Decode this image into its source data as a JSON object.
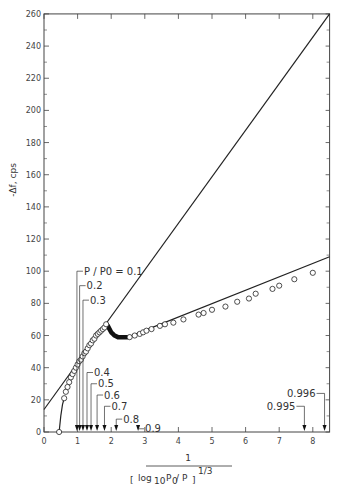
{
  "chart_data": {
    "type": "scatter",
    "title": "",
    "xlabel_numerator": "1",
    "xlabel_denominator": "[log10 P0 / P]^(1/3)",
    "ylabel": "-Δf, cps",
    "xlim": [
      0,
      8.5
    ],
    "ylim": [
      0,
      260
    ],
    "x_ticks": [
      0,
      1,
      2,
      3,
      4,
      5,
      6,
      7,
      8
    ],
    "y_ticks": [
      0,
      20,
      40,
      60,
      80,
      100,
      120,
      140,
      160,
      180,
      200,
      220,
      240,
      260
    ],
    "grid": false,
    "series": [
      {
        "name": "measured points (low pressure branch)",
        "marker": "open-circle",
        "x": [
          0.45,
          0.6,
          0.65,
          0.7,
          0.75,
          0.8,
          0.85,
          0.9,
          0.95,
          1.0,
          1.05,
          1.1,
          1.15,
          1.2,
          1.25,
          1.3,
          1.35,
          1.4,
          1.45,
          1.5,
          1.55,
          1.6,
          1.65,
          1.7,
          1.75,
          1.8,
          1.85
        ],
        "y": [
          0,
          21,
          25,
          28,
          31,
          34,
          36,
          38,
          40,
          42,
          44,
          45,
          47,
          49,
          50,
          52,
          54,
          55,
          57,
          58,
          60,
          61,
          62,
          63,
          64,
          65,
          67
        ]
      },
      {
        "name": "measured points (high pressure branch)",
        "marker": "open-circle",
        "x": [
          2.55,
          2.7,
          2.85,
          2.95,
          3.05,
          3.2,
          3.45,
          3.6,
          3.85,
          4.15,
          4.6,
          4.75,
          5.0,
          5.4,
          5.75,
          6.1,
          6.3,
          6.8,
          7.0,
          7.45,
          8.0
        ],
        "y": [
          59,
          60,
          61,
          62,
          63,
          64,
          66,
          67,
          68,
          70,
          73,
          74,
          76,
          78,
          81,
          83,
          86,
          89,
          91,
          95,
          99
        ]
      },
      {
        "name": "transition (dense points)",
        "marker": "filled-thick",
        "x": [
          1.85,
          1.9,
          1.95,
          2.0,
          2.05,
          2.1,
          2.2,
          2.3,
          2.4,
          2.5
        ],
        "y": [
          67,
          66,
          64,
          62,
          61,
          60,
          59,
          59,
          59,
          59
        ]
      },
      {
        "name": "straight line fit (upper)",
        "type": "line",
        "x": [
          0,
          8.5
        ],
        "y": [
          14,
          260
        ]
      },
      {
        "name": "straight line fit (lower)",
        "type": "line",
        "x": [
          2.5,
          8.5
        ],
        "y": [
          59,
          109
        ]
      },
      {
        "name": "low-pressure curve",
        "type": "line",
        "x": [
          0.45,
          0.5,
          0.55,
          0.6
        ],
        "y": [
          0,
          10,
          17,
          21
        ]
      }
    ],
    "annotations": [
      {
        "label": "P / P0 = 0.1",
        "x": 0.98,
        "label_y": 100
      },
      {
        "label": "0.2",
        "x": 1.06,
        "label_y": 91
      },
      {
        "label": "0.3",
        "x": 1.16,
        "label_y": 82
      },
      {
        "label": "0.4",
        "x": 1.28,
        "label_y": 37
      },
      {
        "label": "0.5",
        "x": 1.4,
        "label_y": 30
      },
      {
        "label": "0.6",
        "x": 1.58,
        "label_y": 23
      },
      {
        "label": "0.7",
        "x": 1.8,
        "label_y": 16
      },
      {
        "label": "0.8",
        "x": 2.15,
        "label_y": 8
      },
      {
        "label": "0.9",
        "x": 2.8,
        "label_y": 2
      },
      {
        "label": "0.995",
        "x": 7.75,
        "label_y": 16
      },
      {
        "label": "0.996",
        "x": 8.35,
        "label_y": 24
      }
    ]
  },
  "labels": {
    "ylabel": "-Δf, cps",
    "xlabel_num": "1",
    "xlabel_log": "log",
    "xlabel_sub10": "10",
    "xlabel_p0": "P",
    "xlabel_sub0": "0",
    "xlabel_rest": " / P",
    "xlabel_exp": "1/3"
  }
}
